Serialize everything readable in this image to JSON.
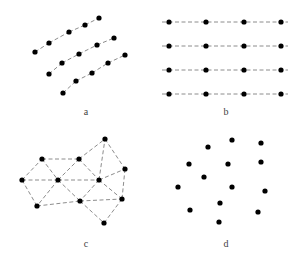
{
  "figure": {
    "style": {
      "dot_color": "#000000",
      "edge_color": "#6e6e6e",
      "label_color": "#444444",
      "dot_radius": 2.6
    },
    "panels": [
      {
        "id": "a",
        "label": "a",
        "label_pos": [
          86,
          115
        ],
        "description": "three parallel curved dashed lines of points",
        "polylines": [
          [
            [
              35,
              52
            ],
            [
              49,
              43
            ],
            [
              69,
              32
            ],
            [
              85,
              25
            ],
            [
              99,
              18
            ]
          ],
          [
            [
              49,
              74
            ],
            [
              62,
              63
            ],
            [
              79,
              54
            ],
            [
              97,
              45
            ],
            [
              114,
              38
            ]
          ],
          [
            [
              63,
              93
            ],
            [
              76,
              81
            ],
            [
              92,
              73
            ],
            [
              108,
              63
            ],
            [
              125,
              55
            ]
          ]
        ]
      },
      {
        "id": "b",
        "label": "b",
        "label_pos": [
          226,
          115
        ],
        "description": "regular grid of points on horizontal dashed lines",
        "rows_y": [
          22,
          46,
          70,
          94
        ],
        "cols_x": [
          169,
          206,
          244,
          281
        ],
        "line_x_range": [
          162,
          288
        ]
      },
      {
        "id": "c",
        "label": "c",
        "label_pos": [
          86,
          247
        ],
        "description": "irregular triangulated mesh of points",
        "nodes": {
          "A": [
            22,
            180
          ],
          "B": [
            42,
            159
          ],
          "C": [
            58,
            180
          ],
          "D": [
            37,
            206
          ],
          "E": [
            79,
            159
          ],
          "F": [
            99,
            180
          ],
          "G": [
            80,
            201
          ],
          "H": [
            105,
            139
          ],
          "I": [
            125,
            169
          ],
          "J": [
            122,
            199
          ],
          "K": [
            104,
            223
          ]
        },
        "edges": [
          [
            "A",
            "B"
          ],
          [
            "A",
            "C"
          ],
          [
            "A",
            "D"
          ],
          [
            "B",
            "E"
          ],
          [
            "B",
            "C"
          ],
          [
            "C",
            "D"
          ],
          [
            "C",
            "E"
          ],
          [
            "C",
            "F"
          ],
          [
            "C",
            "G"
          ],
          [
            "E",
            "H"
          ],
          [
            "E",
            "F"
          ],
          [
            "F",
            "H"
          ],
          [
            "F",
            "I"
          ],
          [
            "F",
            "G"
          ],
          [
            "F",
            "J"
          ],
          [
            "H",
            "I"
          ],
          [
            "I",
            "J"
          ],
          [
            "D",
            "G"
          ],
          [
            "G",
            "J"
          ],
          [
            "G",
            "K"
          ],
          [
            "J",
            "K"
          ]
        ]
      },
      {
        "id": "d",
        "label": "d",
        "label_pos": [
          226,
          247
        ],
        "description": "scattered unconnected points",
        "points": [
          [
            208,
            147
          ],
          [
            232,
            140
          ],
          [
            261,
            143
          ],
          [
            189,
            164
          ],
          [
            228,
            164
          ],
          [
            261,
            162
          ],
          [
            204,
            177
          ],
          [
            178,
            187
          ],
          [
            232,
            187
          ],
          [
            265,
            191
          ],
          [
            220,
            203
          ],
          [
            190,
            210
          ],
          [
            258,
            212
          ],
          [
            219,
            222
          ]
        ]
      }
    ]
  }
}
